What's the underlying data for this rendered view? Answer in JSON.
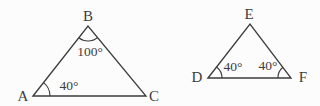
{
  "figure": {
    "background_color": "#fcfcfc",
    "line_color": "#3b3b3b",
    "text_color": "#3c3c3c",
    "triangle_abc": {
      "vertex_labels": {
        "a": "A",
        "b": "B",
        "c": "C"
      },
      "angle_labels": {
        "at_b": "100°",
        "at_a": "40°"
      }
    },
    "triangle_def": {
      "vertex_labels": {
        "d": "D",
        "e": "E",
        "f": "F"
      },
      "angle_labels": {
        "at_d": "40°",
        "at_f": "40°"
      }
    }
  }
}
